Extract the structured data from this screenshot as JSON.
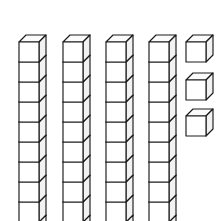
{
  "scene": {
    "title": "Base Ten Blocks",
    "description": "Base-ten block place value model drawn in oblique projection",
    "background_color": "#ffffff",
    "line_color": "#1a1a1a",
    "face_fill": "#ffffff",
    "top_face_fill": "#fbfbfb",
    "side_face_fill": "#f2f2f2",
    "width": 218,
    "height": 221
  },
  "model": {
    "type": "base-ten-blocks",
    "rod_count": 4,
    "cubes_per_rod": 10,
    "unit_cube_count": 3,
    "tens_value": 40,
    "ones_value": 3,
    "total_value": 43
  },
  "geometry": {
    "cube_size": 20,
    "depth_x": 7,
    "depth_y": 7,
    "rod_x_positions": [
      19,
      63,
      106,
      149
    ],
    "rod_top_y": 42,
    "unit_cube_x": 186,
    "unit_cube_y_positions": [
      42,
      80,
      116
    ]
  },
  "rods": [
    {
      "name": "tens-rod-1",
      "index": 1,
      "cubes": 10,
      "value": 10
    },
    {
      "name": "tens-rod-2",
      "index": 2,
      "cubes": 10,
      "value": 10
    },
    {
      "name": "tens-rod-3",
      "index": 3,
      "cubes": 10,
      "value": 10
    },
    {
      "name": "tens-rod-4",
      "index": 4,
      "cubes": 10,
      "value": 10
    }
  ],
  "unit_cubes": [
    {
      "name": "unit-cube-1",
      "index": 1,
      "value": 1
    },
    {
      "name": "unit-cube-2",
      "index": 2,
      "value": 1
    },
    {
      "name": "unit-cube-3",
      "index": 3,
      "value": 1
    }
  ]
}
